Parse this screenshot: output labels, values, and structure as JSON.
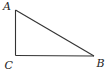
{
  "diagram": {
    "type": "right-triangle",
    "vertices": [
      {
        "name": "A",
        "label": "A",
        "x": 15.5,
        "y": 10,
        "label_x": 3,
        "label_y": 10
      },
      {
        "name": "C",
        "label": "C",
        "x": 15.5,
        "y": 55.5,
        "label_x": 4.5,
        "label_y": 69
      },
      {
        "name": "B",
        "label": "B",
        "x": 94,
        "y": 56,
        "label_x": 96.5,
        "label_y": 67
      }
    ],
    "sides": [
      {
        "from": "A",
        "to": "C"
      },
      {
        "from": "C",
        "to": "B"
      },
      {
        "from": "A",
        "to": "B"
      }
    ],
    "right_angle_at": "C",
    "stroke_color": "#333333"
  }
}
